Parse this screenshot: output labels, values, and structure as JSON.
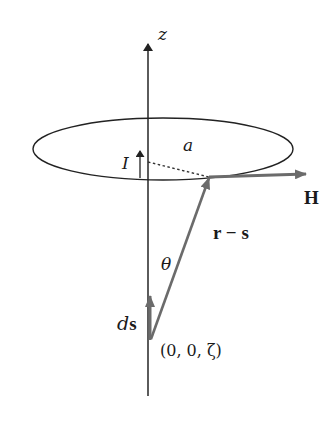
{
  "figure": {
    "colors": {
      "line": "#222222",
      "vector": "#6b6b6b",
      "background": "#ffffff"
    },
    "labels": {
      "z_axis": "z",
      "current": "I",
      "radius": "a",
      "field": "H",
      "separation": "r − s",
      "angle": "θ",
      "element_d": "d",
      "element_s": "s",
      "origin_point": "(0, 0, ζ)"
    }
  }
}
